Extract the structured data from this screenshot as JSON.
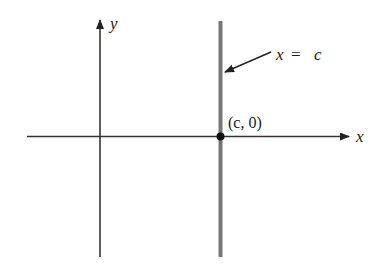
{
  "diagram": {
    "type": "coordinate-plane",
    "axes": {
      "x_label": "x",
      "y_label": "y"
    },
    "vertical_line": {
      "label_var": "x",
      "label_eq": "=",
      "label_const": "c",
      "color": "#777777"
    },
    "point": {
      "label": "(c, 0)",
      "color": "#111111"
    },
    "colors": {
      "axis": "#333333",
      "background": "#ffffff"
    }
  }
}
